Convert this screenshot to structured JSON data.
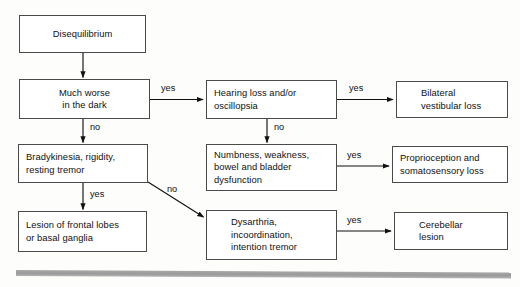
{
  "diagram": {
    "colors": {
      "box_border": "#4a4a4a",
      "box_fill": "#ffffff",
      "arrow": "#111111",
      "text": "#111111",
      "page_background": "#fdfdfc",
      "footer_bar": "#a0a0a0"
    },
    "nodes": [
      {
        "id": "disequilibrium",
        "lines": [
          "Disequilibrium"
        ]
      },
      {
        "id": "much-worse-in-the-dark",
        "lines": [
          "Much worse",
          "in the dark"
        ]
      },
      {
        "id": "bradykinesia-rigidity-resting-tremor",
        "lines": [
          "Bradykinesia, rigidity,",
          "resting tremor"
        ]
      },
      {
        "id": "lesion-of-frontal-lobes-or-basal-ganglia",
        "lines": [
          "Lesion of frontal lobes",
          "or basal ganglia"
        ]
      },
      {
        "id": "hearing-loss-and-or-oscillopsia",
        "lines": [
          "Hearing loss and/or",
          "oscillopsia"
        ]
      },
      {
        "id": "numbness-weakness-bowel-and-bladder-dysfunction",
        "lines": [
          "Numbness, weakness,",
          "bowel and bladder",
          "dysfunction"
        ]
      },
      {
        "id": "dysarthria-incoordination-intention-tremor",
        "lines": [
          "Dysarthria,",
          "incoordination,",
          "intention tremor"
        ]
      },
      {
        "id": "bilateral-vestibular-loss",
        "lines": [
          "Bilateral",
          "vestibular loss"
        ]
      },
      {
        "id": "proprioception-and-somatosensory-loss",
        "lines": [
          "Proprioception and",
          "somatosensory loss"
        ]
      },
      {
        "id": "cerebellar-lesion",
        "lines": [
          "Cerebellar",
          "lesion"
        ]
      }
    ],
    "edges": [
      {
        "id": "disequilibrium-to-much-worse",
        "label": ""
      },
      {
        "id": "much-worse-yes-to-hearing-loss",
        "label": "yes"
      },
      {
        "id": "much-worse-no-to-bradykinesia",
        "label": "no"
      },
      {
        "id": "bradykinesia-yes-to-lesion",
        "label": "yes"
      },
      {
        "id": "bradykinesia-no-to-dysarthria",
        "label": "no"
      },
      {
        "id": "hearing-loss-yes-to-bilateral",
        "label": "yes"
      },
      {
        "id": "hearing-loss-no-to-numbness",
        "label": "no"
      },
      {
        "id": "numbness-yes-to-proprioception",
        "label": "yes"
      },
      {
        "id": "dysarthria-yes-to-cerebellar",
        "label": "yes"
      }
    ]
  }
}
